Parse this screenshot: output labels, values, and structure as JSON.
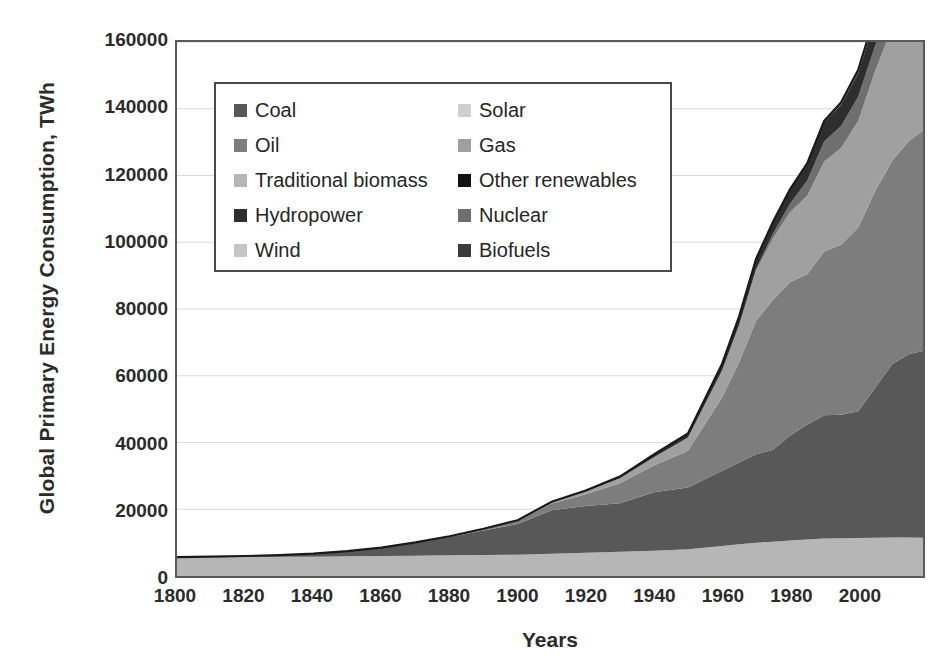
{
  "chart_data": {
    "type": "area",
    "title": "",
    "xlabel": "Years",
    "ylabel": "Global Primary Energy Consumption, TWh",
    "xlim": [
      1800,
      2019
    ],
    "ylim": [
      0,
      160000
    ],
    "xticks": [
      1800,
      1820,
      1840,
      1860,
      1880,
      1900,
      1920,
      1940,
      1960,
      1980,
      2000
    ],
    "yticks": [
      0,
      20000,
      40000,
      60000,
      80000,
      100000,
      120000,
      140000,
      160000
    ],
    "grid": "horizontal",
    "stacked": true,
    "legend_position": "top-left-inside",
    "legend_columns": 2,
    "x": [
      1800,
      1810,
      1820,
      1830,
      1840,
      1850,
      1860,
      1870,
      1880,
      1890,
      1900,
      1910,
      1920,
      1930,
      1940,
      1950,
      1960,
      1965,
      1970,
      1975,
      1980,
      1985,
      1990,
      1995,
      2000,
      2005,
      2010,
      2015,
      2019
    ],
    "series": [
      {
        "name": "Traditional biomass",
        "color": "#b6b6b6",
        "values": [
          5556,
          5610,
          5670,
          5733,
          5800,
          5889,
          6000,
          6100,
          6200,
          6300,
          6400,
          6700,
          7000,
          7300,
          7600,
          8000,
          9000,
          9500,
          10000,
          10300,
          10600,
          10900,
          11200,
          11300,
          11400,
          11450,
          11500,
          11500,
          11450
        ]
      },
      {
        "name": "Coal",
        "color": "#585858",
        "values": [
          97,
          180,
          320,
          530,
          900,
          1550,
          2500,
          3900,
          5500,
          7300,
          9200,
          13000,
          14000,
          14500,
          17500,
          18500,
          22500,
          24500,
          26500,
          27500,
          31500,
          34500,
          37000,
          37000,
          38000,
          45000,
          52000,
          55000,
          56000
        ]
      },
      {
        "name": "Oil",
        "color": "#7d7d7d",
        "values": [
          0,
          0,
          0,
          0,
          0,
          0,
          0,
          60,
          200,
          500,
          900,
          2000,
          3500,
          6000,
          8000,
          11000,
          22000,
          30000,
          40000,
          45000,
          46000,
          45000,
          49000,
          51000,
          55000,
          59000,
          61000,
          64000,
          66000
        ]
      },
      {
        "name": "Gas",
        "color": "#a0a0a0",
        "values": [
          0,
          0,
          0,
          0,
          0,
          0,
          0,
          0,
          0,
          50,
          150,
          400,
          800,
          1500,
          2500,
          4000,
          8000,
          11000,
          15000,
          18500,
          21000,
          23500,
          27000,
          29000,
          32000,
          36000,
          40000,
          42500,
          45000
        ]
      },
      {
        "name": "Nuclear",
        "color": "#6f6f6f",
        "values": [
          0,
          0,
          0,
          0,
          0,
          0,
          0,
          0,
          0,
          0,
          0,
          0,
          0,
          0,
          0,
          0,
          60,
          200,
          500,
          1300,
          2500,
          4500,
          6000,
          6600,
          7300,
          7600,
          7400,
          6700,
          7000
        ]
      },
      {
        "name": "Hydropower",
        "color": "#2e2e2e",
        "values": [
          0,
          0,
          0,
          0,
          0,
          0,
          0,
          0,
          0,
          20,
          60,
          150,
          300,
          500,
          800,
          1200,
          2000,
          2500,
          3000,
          3600,
          4200,
          5000,
          5700,
          6400,
          7000,
          7800,
          9000,
          9800,
          10500
        ]
      },
      {
        "name": "Wind",
        "color": "#c5c5c5",
        "values": [
          0,
          0,
          0,
          0,
          0,
          0,
          0,
          0,
          0,
          0,
          0,
          0,
          0,
          0,
          0,
          0,
          0,
          0,
          0,
          0,
          0,
          5,
          10,
          20,
          80,
          200,
          600,
          1200,
          1900
        ]
      },
      {
        "name": "Solar",
        "color": "#cfcfcf",
        "values": [
          0,
          0,
          0,
          0,
          0,
          0,
          0,
          0,
          0,
          0,
          0,
          0,
          0,
          0,
          0,
          0,
          0,
          0,
          0,
          0,
          0,
          0,
          2,
          4,
          10,
          30,
          100,
          500,
          1100
        ]
      },
      {
        "name": "Biofuels",
        "color": "#3a3a3a",
        "values": [
          0,
          0,
          0,
          0,
          0,
          0,
          0,
          0,
          0,
          0,
          0,
          0,
          0,
          0,
          0,
          0,
          0,
          0,
          0,
          0,
          10,
          40,
          100,
          200,
          300,
          500,
          800,
          1000,
          1100
        ]
      },
      {
        "name": "Other renewables",
        "color": "#111111",
        "values": [
          0,
          0,
          0,
          0,
          0,
          0,
          0,
          0,
          0,
          0,
          0,
          0,
          0,
          0,
          0,
          0,
          0,
          10,
          30,
          60,
          110,
          200,
          330,
          460,
          620,
          800,
          1050,
          1400,
          1700
        ]
      }
    ]
  },
  "legend": {
    "rows": [
      {
        "left": {
          "label": "Coal",
          "color": "#585858"
        },
        "right": {
          "label": "Solar",
          "color": "#cfcfcf"
        }
      },
      {
        "left": {
          "label": "Oil",
          "color": "#7d7d7d"
        },
        "right": {
          "label": "Gas",
          "color": "#a0a0a0"
        }
      },
      {
        "left": {
          "label": "Traditional biomass",
          "color": "#b6b6b6"
        },
        "right": {
          "label": "Other renewables",
          "color": "#111111"
        }
      },
      {
        "left": {
          "label": "Hydropower",
          "color": "#2e2e2e"
        },
        "right": {
          "label": "Nuclear",
          "color": "#6f6f6f"
        }
      },
      {
        "left": {
          "label": "Wind",
          "color": "#c5c5c5"
        },
        "right": {
          "label": "Biofuels",
          "color": "#3a3a3a"
        }
      }
    ]
  },
  "axes": {
    "y_title": "Global Primary Energy Consumption, TWh",
    "x_title": "Years",
    "y_labels": [
      "160000",
      "140000",
      "120000",
      "100000",
      "80000",
      "60000",
      "40000",
      "20000",
      "0"
    ],
    "x_labels": [
      "1800",
      "1820",
      "1840",
      "1860",
      "1880",
      "1900",
      "1920",
      "1940",
      "1960",
      "1980",
      "2000"
    ]
  },
  "style": {
    "grid_color": "#d9d9d9",
    "axis_color": "#5a5a5a",
    "text_color": "#2b2b2b",
    "outline_color": "#1a1a1a"
  }
}
